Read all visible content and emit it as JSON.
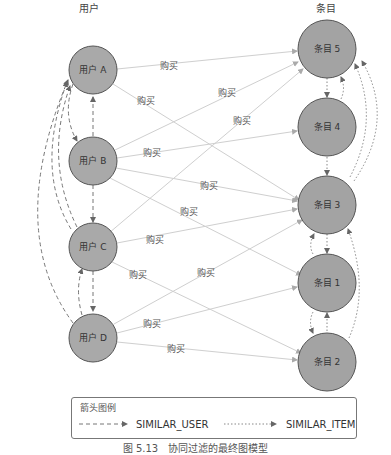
{
  "columns": {
    "users_title": "用户",
    "items_title": "条目"
  },
  "users": [
    {
      "id": "A",
      "label": "用户 A"
    },
    {
      "id": "B",
      "label": "用户 B"
    },
    {
      "id": "C",
      "label": "用户 C"
    },
    {
      "id": "D",
      "label": "用户 D"
    }
  ],
  "items": [
    {
      "id": "5",
      "label": "条目 5"
    },
    {
      "id": "4",
      "label": "条目 4"
    },
    {
      "id": "3",
      "label": "条目 3"
    },
    {
      "id": "1",
      "label": "条目 1"
    },
    {
      "id": "2",
      "label": "条目 2"
    }
  ],
  "edges": {
    "purchase_label": "购买",
    "purchases": [
      {
        "from": "A",
        "to": "5"
      },
      {
        "from": "A",
        "to": "3"
      },
      {
        "from": "B",
        "to": "5"
      },
      {
        "from": "B",
        "to": "4"
      },
      {
        "from": "B",
        "to": "3"
      },
      {
        "from": "B",
        "to": "1"
      },
      {
        "from": "C",
        "to": "5"
      },
      {
        "from": "C",
        "to": "3"
      },
      {
        "from": "C",
        "to": "2"
      },
      {
        "from": "D",
        "to": "3"
      },
      {
        "from": "D",
        "to": "1"
      },
      {
        "from": "D",
        "to": "2"
      }
    ]
  },
  "legend": {
    "title": "箭头图例",
    "similar_user": "SIMILAR_USER",
    "similar_item": "SIMILAR_ITEM"
  },
  "caption": "图 5.13　协同过滤的最终图模型",
  "colors": {
    "node_fill": "#a9a9a9",
    "node_stroke": "#555555",
    "edge": "#c8c8c8",
    "similar": "#888888"
  }
}
